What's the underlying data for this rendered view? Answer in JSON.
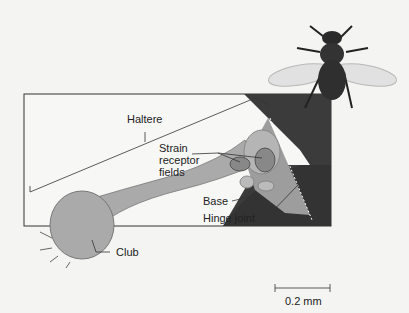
{
  "diagram": {
    "labels": {
      "haltere": "Haltere",
      "strain1": "Strain",
      "strain2": "receptor",
      "strain3": "fields",
      "base": "Base",
      "hinge": "Hinge joint",
      "club": "Club"
    },
    "scale_bar": "0.2 mm",
    "colors": {
      "background": "#f4f4f2",
      "body_dark": "#3a3a3a",
      "haltere_fill": "#a9a9a9",
      "frame": "#333333"
    }
  }
}
